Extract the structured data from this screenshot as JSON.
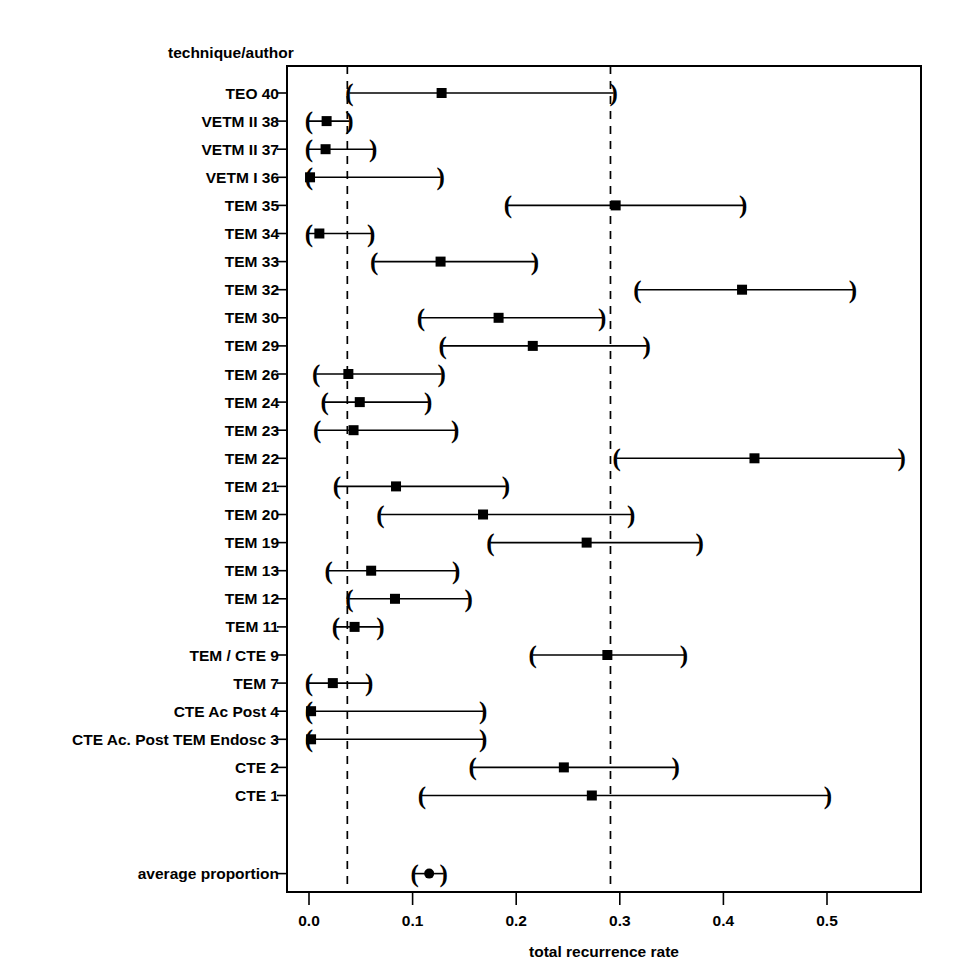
{
  "header": {
    "column_title": "technique/author"
  },
  "axis": {
    "x_title": "total recurrence rate",
    "x_ticks": [
      "0.0",
      "0.1",
      "0.2",
      "0.3",
      "0.4",
      "0.5"
    ],
    "x_tick_values": [
      0.0,
      0.1,
      0.2,
      0.3,
      0.4,
      0.5
    ],
    "x_min": 0.0,
    "x_max": 0.572
  },
  "reference_lines": [
    0.037,
    0.291
  ],
  "chart_data": {
    "type": "scatter",
    "subtype": "forest-plot",
    "title": "",
    "xlabel": "total recurrence rate",
    "ylabel": "technique/author",
    "xlim": [
      0.0,
      0.58
    ],
    "grid": false,
    "legend": "none",
    "reference_lines": [
      0.037,
      0.291
    ],
    "categories": [
      "TEO 40",
      "VETM II 38",
      "VETM II 37",
      "VETM I 36",
      "TEM 35",
      "TEM 34",
      "TEM 33",
      "TEM 32",
      "TEM 30",
      "TEM 29",
      "TEM 26",
      "TEM 24",
      "TEM 23",
      "TEM 22",
      "TEM 21",
      "TEM 20",
      "TEM 19",
      "TEM 13",
      "TEM 12",
      "TEM 11",
      "TEM / CTE 9",
      "TEM 7",
      "CTE Ac Post 4",
      "CTE Ac. Post TEM Endosc 3",
      "CTE 2",
      "CTE 1",
      "average proportion"
    ],
    "rows": [
      {
        "label": "TEO 40",
        "estimate": 0.128,
        "ci_low": 0.039,
        "ci_high": 0.294,
        "marker": "square"
      },
      {
        "label": "VETM II 38",
        "estimate": 0.017,
        "ci_low": 0.0,
        "ci_high": 0.039,
        "marker": "square"
      },
      {
        "label": "VETM II 37",
        "estimate": 0.016,
        "ci_low": 0.0,
        "ci_high": 0.062,
        "marker": "square"
      },
      {
        "label": "VETM I 36",
        "estimate": 0.001,
        "ci_low": 0.0,
        "ci_high": 0.127,
        "marker": "square"
      },
      {
        "label": "TEM 35",
        "estimate": 0.296,
        "ci_low": 0.192,
        "ci_high": 0.419,
        "marker": "square"
      },
      {
        "label": "TEM 34",
        "estimate": 0.01,
        "ci_low": 0.0,
        "ci_high": 0.06,
        "marker": "square"
      },
      {
        "label": "TEM 33",
        "estimate": 0.127,
        "ci_low": 0.063,
        "ci_high": 0.218,
        "marker": "square"
      },
      {
        "label": "TEM 32",
        "estimate": 0.418,
        "ci_low": 0.317,
        "ci_high": 0.525,
        "marker": "square"
      },
      {
        "label": "TEM 30",
        "estimate": 0.183,
        "ci_low": 0.108,
        "ci_high": 0.283,
        "marker": "square"
      },
      {
        "label": "TEM 29",
        "estimate": 0.216,
        "ci_low": 0.129,
        "ci_high": 0.326,
        "marker": "square"
      },
      {
        "label": "TEM 26",
        "estimate": 0.038,
        "ci_low": 0.007,
        "ci_high": 0.128,
        "marker": "square"
      },
      {
        "label": "TEM 24",
        "estimate": 0.049,
        "ci_low": 0.015,
        "ci_high": 0.115,
        "marker": "square"
      },
      {
        "label": "TEM 23",
        "estimate": 0.043,
        "ci_low": 0.008,
        "ci_high": 0.141,
        "marker": "square"
      },
      {
        "label": "TEM 22",
        "estimate": 0.43,
        "ci_low": 0.297,
        "ci_high": 0.572,
        "marker": "square"
      },
      {
        "label": "TEM 21",
        "estimate": 0.084,
        "ci_low": 0.027,
        "ci_high": 0.19,
        "marker": "square"
      },
      {
        "label": "TEM 20",
        "estimate": 0.168,
        "ci_low": 0.069,
        "ci_high": 0.311,
        "marker": "square"
      },
      {
        "label": "TEM 19",
        "estimate": 0.268,
        "ci_low": 0.175,
        "ci_high": 0.377,
        "marker": "square"
      },
      {
        "label": "TEM 13",
        "estimate": 0.06,
        "ci_low": 0.019,
        "ci_high": 0.142,
        "marker": "square"
      },
      {
        "label": "TEM 12",
        "estimate": 0.083,
        "ci_low": 0.039,
        "ci_high": 0.154,
        "marker": "square"
      },
      {
        "label": "TEM 11",
        "estimate": 0.044,
        "ci_low": 0.026,
        "ci_high": 0.069,
        "marker": "square"
      },
      {
        "label": "TEM / CTE 9",
        "estimate": 0.288,
        "ci_low": 0.216,
        "ci_high": 0.362,
        "marker": "square"
      },
      {
        "label": "TEM 7",
        "estimate": 0.023,
        "ci_low": 0.0,
        "ci_high": 0.058,
        "marker": "square"
      },
      {
        "label": "CTE Ac Post 4",
        "estimate": 0.002,
        "ci_low": 0.0,
        "ci_high": 0.168,
        "marker": "square"
      },
      {
        "label": "CTE Ac. Post TEM Endosc 3",
        "estimate": 0.002,
        "ci_low": 0.0,
        "ci_high": 0.168,
        "marker": "square"
      },
      {
        "label": "CTE 2",
        "estimate": 0.246,
        "ci_low": 0.158,
        "ci_high": 0.354,
        "marker": "square"
      },
      {
        "label": "CTE 1",
        "estimate": 0.273,
        "ci_low": 0.109,
        "ci_high": 0.501,
        "marker": "square"
      },
      {
        "label": "average proportion",
        "estimate": 0.116,
        "ci_low": 0.102,
        "ci_high": 0.13,
        "marker": "circle"
      }
    ]
  },
  "colors": {
    "foreground": "#000000",
    "background": "#ffffff"
  }
}
